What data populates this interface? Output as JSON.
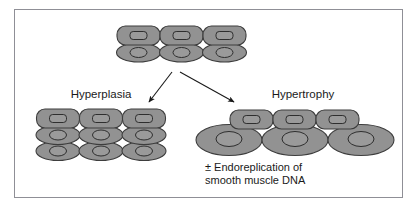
{
  "figure": {
    "background_color": "#ffffff",
    "frame_color": "#8f8f96",
    "cell_fill": "#929292",
    "cell_stroke": "#3d3d3d",
    "nucleus_fill": "#9a9a9a",
    "nucleus_stroke": "#2e2e2e",
    "arrow_color": "#1a1a1a",
    "text_color": "#1a1a1a"
  },
  "labels": {
    "hyperplasia": "Hyperplasia",
    "hypertrophy": "Hypertrophy"
  },
  "caption": {
    "line1": "± Endoreplication of",
    "line2": "smooth muscle DNA"
  },
  "diagram_data": {
    "type": "diagram",
    "description": "A starting cluster of smooth muscle cells branches via two arrows into two outcomes: hyperplasia (more cells of the same size) and hypertrophy (fewer, much larger cells).",
    "groups": [
      {
        "id": "baseline",
        "name": "baseline-cell-cluster",
        "rows": [
          {
            "shape": "rounded-rect",
            "count": 3
          },
          {
            "shape": "ellipse",
            "count": 3
          }
        ],
        "total_cells": 6,
        "cell_size": "normal"
      },
      {
        "id": "hyperplasia",
        "name": "hyperplasia-cell-cluster",
        "label": "Hyperplasia",
        "rows": [
          {
            "shape": "rounded-rect",
            "count": 3
          },
          {
            "shape": "ellipse",
            "count": 3
          },
          {
            "shape": "ellipse",
            "count": 3
          }
        ],
        "total_cells": 9,
        "cell_size": "normal"
      },
      {
        "id": "hypertrophy",
        "name": "hypertrophy-cell-cluster",
        "label": "Hypertrophy",
        "rows": [
          {
            "shape": "rounded-rect",
            "count": 3,
            "size": "normal"
          },
          {
            "shape": "ellipse",
            "count": 3,
            "size": "enlarged"
          }
        ],
        "total_cells": 6,
        "cell_size": "enlarged"
      }
    ],
    "arrows": [
      {
        "name": "arrow-to-hyperplasia",
        "from": [
          172,
          72
        ],
        "to": [
          147,
          104
        ]
      },
      {
        "name": "arrow-to-hypertrophy",
        "from": [
          180,
          72
        ],
        "to": [
          236,
          104
        ]
      }
    ]
  }
}
